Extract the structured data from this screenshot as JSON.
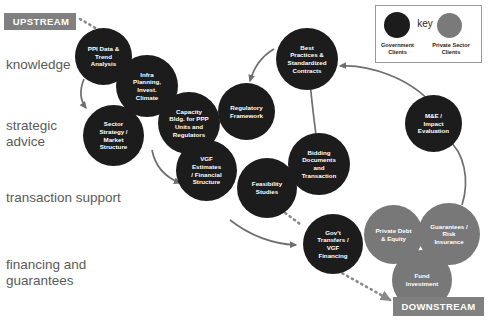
{
  "diagram": {
    "upstream_label": "UPSTREAM",
    "downstream_label": "DOWNSTREAM",
    "colors": {
      "government": "#1c1c1c",
      "private_sector": "#787878",
      "banner": "#808080",
      "row_label": "#5a5a5a",
      "arrow": "#6e6e6e"
    },
    "row_labels": [
      {
        "id": "knowledge",
        "text": "knowledge"
      },
      {
        "id": "strategic",
        "text": "strategic\nadvice"
      },
      {
        "id": "transaction",
        "text": "transaction support"
      },
      {
        "id": "financing",
        "text": "financing and\nguarantees"
      }
    ],
    "legend": {
      "title": "key",
      "entries": [
        {
          "id": "government",
          "label": "Government\nClients",
          "color": "#1c1c1c"
        },
        {
          "id": "private-sector",
          "label": "Private Sector\nClients",
          "color": "#7a7a7a"
        }
      ]
    },
    "nodes": [
      {
        "id": "ppi-data-trend-analysis",
        "label": "PPI Data &\nTrend\nAnalysis",
        "client": "government"
      },
      {
        "id": "infra-planning-invest-climate",
        "label": "Infra\nPlanning,\nInvest.\nClimate",
        "client": "government"
      },
      {
        "id": "sector-strategy-market-structure",
        "label": "Sector\nStrategy /\nMarket\nStructure",
        "client": "government"
      },
      {
        "id": "capacity-bldg-ppp-units-regulators",
        "label": "Capacity\nBldg. for PPP\nUnits and\nRegulators",
        "client": "government"
      },
      {
        "id": "regulatory-framework",
        "label": "Regulatory\nFramework",
        "client": "government"
      },
      {
        "id": "vgf-estimates-financial-structure",
        "label": "VGF\nEstimates\n/ Financial\nStructure",
        "client": "government"
      },
      {
        "id": "best-practices-standardized-contracts",
        "label": "Best\nPractices &\nStandardized\nContracts",
        "client": "government"
      },
      {
        "id": "me-impact-evaluation",
        "label": "M&E /\nImpact\nEvaluation",
        "client": "government"
      },
      {
        "id": "feasibility-studies",
        "label": "Feasibility\nStudies",
        "client": "government"
      },
      {
        "id": "bidding-documents-and-transaction",
        "label": "Bidding\nDocuments\nand\nTransaction",
        "client": "government"
      },
      {
        "id": "govt-transfers-vgf-financing",
        "label": "Gov't\nTransfers /\nVGF\nFinancing",
        "client": "government"
      },
      {
        "id": "private-debt-equity",
        "label": "Private Debt\n& Equity",
        "client": "private-sector"
      },
      {
        "id": "guarantees-risk-insurance",
        "label": "Guarantees /\nRisk\nInsurance",
        "client": "private-sector"
      },
      {
        "id": "fund-investment",
        "label": "Fund\nInvestment",
        "client": "private-sector"
      }
    ]
  }
}
